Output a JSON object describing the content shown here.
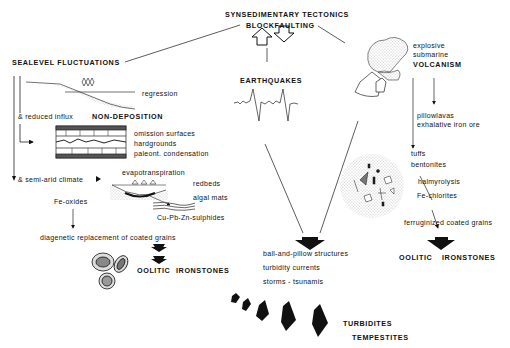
{
  "title": "SYNSEDIMENTARY TECTONICS",
  "subtitle": "BLOCKFAULTING",
  "left": {
    "heading": "SEALEVEL FLUCTUATIONS",
    "regression": "regression",
    "reduced_influx": "& reduced influx",
    "non_deposition": "NON-DEPOSITION",
    "omission": [
      "omission surfaces",
      "hardgrounds",
      "paleont. condensation"
    ],
    "semi_arid": "& semi-arid climate",
    "evapotranspiration": "evapotranspiration",
    "redbeds": "redbeds",
    "algal_mats": "algal mats",
    "sulphides": "Cu-Pb-Zn-sulphides",
    "fe_oxides": "Fe-oxides",
    "diagenetic": "diagenetic replacement of coated grains",
    "oolitic": "OOLITIC",
    "ironstones": "IRONSTONES"
  },
  "center": {
    "earthquakes": "EARTHQUAKES",
    "results": [
      "ball-and-pillow structures",
      "turbidity currents",
      "storms - tsunamis"
    ],
    "turbidites": "TURBIDITES",
    "tempestites": "TEMPESTITES"
  },
  "right": {
    "explosive": "explosive",
    "submarine": "submarine",
    "volcanism": "VOLCANISM",
    "pillowlavas": "pillowlavas",
    "exhalative": "exhalative iron ore",
    "tuffs": "tuffs",
    "bentonites": "bentonites",
    "halmyrolysis": "halmyrolysis",
    "fe_chlorites": "Fe-chlorites",
    "ferruginized": "ferruginized coated grains",
    "oolitic": "OOLITIC",
    "ironstones": "IRONSTONES"
  }
}
